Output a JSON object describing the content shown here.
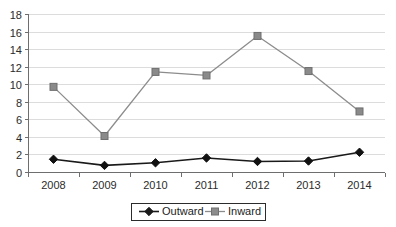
{
  "chart_data": {
    "type": "line",
    "title": "",
    "xlabel": "",
    "ylabel": "",
    "categories": [
      "2008",
      "2009",
      "2010",
      "2011",
      "2012",
      "2013",
      "2014"
    ],
    "x": [
      2008,
      2009,
      2010,
      2011,
      2012,
      2013,
      2014
    ],
    "series": [
      {
        "name": "Outward",
        "values": [
          1.45,
          0.75,
          1.05,
          1.6,
          1.2,
          1.25,
          2.25
        ],
        "color": "#1a1a1a",
        "marker": "diamond",
        "marker_color": "#111111"
      },
      {
        "name": "Inward",
        "values": [
          9.7,
          4.1,
          11.4,
          11.0,
          15.5,
          11.5,
          6.9
        ],
        "color": "#8c8c8c",
        "marker": "square",
        "marker_color": "#8a8a8a"
      }
    ],
    "ylim": [
      0,
      18
    ],
    "y_ticks": [
      0,
      2,
      4,
      6,
      8,
      10,
      12,
      14,
      16,
      18
    ],
    "y_tick_labels": [
      "0",
      "2",
      "4",
      "6",
      "8",
      "10",
      "12",
      "14",
      "16",
      "18"
    ],
    "grid": true,
    "grid_axis": "y",
    "grid_color": "#dcdcdc",
    "axis_color": "#6e6e6e",
    "legend": {
      "position": "bottom",
      "border": true,
      "entries": [
        {
          "label": "Outward",
          "color": "#1a1a1a",
          "marker": "diamond"
        },
        {
          "label": "Inward",
          "color": "#8c8c8c",
          "marker": "square"
        }
      ]
    },
    "background": "#ffffff"
  }
}
